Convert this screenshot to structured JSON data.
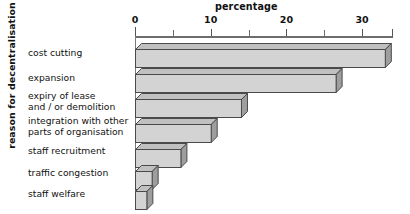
{
  "chart_data": {
    "type": "bar",
    "orientation": "horizontal",
    "title": "percentage",
    "xlabel": "percentage",
    "ylabel": "reason for decentralisation",
    "categories": [
      "cost cutting",
      "expansion",
      "expiry of lease\nand / or demolition",
      "integration with other\nparts of organisation",
      "staff recruitment",
      "traffic congestion",
      "staff welfare"
    ],
    "values": [
      33,
      26.5,
      14,
      10,
      6,
      2.2,
      1.5
    ],
    "xlim": [
      0,
      34
    ],
    "xticks": [
      0,
      5,
      10,
      15,
      20,
      25,
      30
    ],
    "xtick_labels_shown": [
      "0",
      "10",
      "20",
      "30"
    ],
    "grid": false,
    "legend": null,
    "style": "3d-horizontal-bars",
    "bar_face_color": "#d3d3d3",
    "bar_edge_color": "#4a4a4a",
    "bar_top_color": "#c0c0c0",
    "bar_side_color": "#9e9e9e",
    "axis_color": "#6d6d6d",
    "background_color": "#ffffff"
  },
  "axis": {
    "title": "percentage",
    "ylabel": "reason for decentralisation",
    "tick_labels": [
      {
        "text": "0",
        "value": 0
      },
      {
        "text": "10",
        "value": 10
      },
      {
        "text": "20",
        "value": 20
      },
      {
        "text": "30",
        "value": 30
      }
    ],
    "minor_tick_values": [
      5,
      15,
      25
    ]
  },
  "bars": [
    {
      "label": "cost cutting",
      "label_line1": "cost cutting",
      "label_line2": "",
      "value": 33
    },
    {
      "label": "expansion",
      "label_line1": "expansion",
      "label_line2": "",
      "value": 26.5
    },
    {
      "label": "expiry of lease and / or demolition",
      "label_line1": "expiry of lease",
      "label_line2": "and / or demolition",
      "value": 14
    },
    {
      "label": "integration with other parts of organisation",
      "label_line1": "integration with other",
      "label_line2": "parts of organisation",
      "value": 10
    },
    {
      "label": "staff recruitment",
      "label_line1": "staff recruitment",
      "label_line2": "",
      "value": 6
    },
    {
      "label": "traffic congestion",
      "label_line1": "traffic congestion",
      "label_line2": "",
      "value": 2.2
    },
    {
      "label": "staff welfare",
      "label_line1": "staff welfare",
      "label_line2": "",
      "value": 1.5
    }
  ]
}
